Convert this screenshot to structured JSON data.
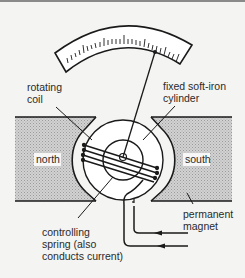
{
  "diagram": {
    "labels": {
      "rotating_coil": [
        "rotating",
        "coil"
      ],
      "fixed_cylinder": [
        "fixed soft-iron",
        "cylinder"
      ],
      "north": "north",
      "south": "south",
      "permanent_magnet": [
        "permanent",
        "magnet"
      ],
      "controlling_spring": [
        "controlling",
        "spring (also",
        "conducts current)"
      ]
    },
    "colors": {
      "line": "#1a1a1a",
      "magnet_fill": "#c8c8c8",
      "background": "#f4f4f2",
      "label_box": "#ffffff"
    },
    "current_arrows": [
      "left",
      "left"
    ]
  }
}
